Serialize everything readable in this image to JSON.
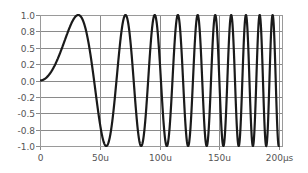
{
  "chart_data": {
    "type": "line",
    "title": "",
    "xlabel": "",
    "ylabel": "",
    "xlim": [
      0,
      200
    ],
    "ylim": [
      -1.0,
      1.0
    ],
    "grid": true,
    "legend": null,
    "x_unit": "µs",
    "x_ticks": [
      0,
      50,
      100,
      150,
      200
    ],
    "x_tick_labels": [
      "0",
      "50u",
      "100u",
      "150u",
      "200µs"
    ],
    "y_ticks": [
      1.0,
      0.75,
      0.5,
      0.25,
      0.0,
      -0.25,
      -0.5,
      -0.75,
      -1.0
    ],
    "y_tick_labels": [
      "1.0",
      "0.8",
      "0.5",
      "0.2",
      "0.0",
      "-0.2",
      "-0.5",
      "-0.8",
      "-1.0"
    ],
    "series": [
      {
        "name": "chirp",
        "description": "Linear chirp y = sin(pi/2 * (t/32us)^2), frequency increasing with time",
        "formula": "sin(1.5708 * (t/32)^2)",
        "color": "#1a1a1a",
        "peaks_t_us": [
          32,
          71.6,
          96,
          115.4,
          130.5,
          144.7,
          158.1,
          170.8,
          182.6,
          194.6
        ],
        "x": [
          0,
          10,
          20,
          32,
          40,
          50,
          60,
          71.6,
          80,
          96,
          100,
          115.4,
          120,
          130.5,
          140,
          150,
          160,
          170,
          180,
          190,
          200
        ],
        "values": [
          0.0,
          0.15,
          0.56,
          1.0,
          0.71,
          -0.66,
          -0.99,
          1.0,
          0.02,
          1.0,
          0.15,
          1.0,
          0.07,
          1.0,
          -0.2,
          0.3,
          -0.98,
          0.82,
          -0.05,
          0.62,
          -0.99
        ]
      }
    ]
  }
}
